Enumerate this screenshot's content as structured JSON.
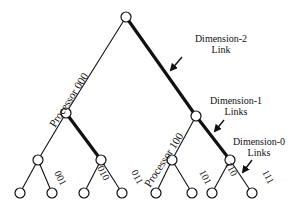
{
  "diagram": {
    "type": "binary-tree-hypercube-embedding",
    "colors": {
      "ink": "#111111",
      "background": "#ffffff"
    },
    "nodes": [
      {
        "id": "root",
        "x": 126,
        "y": 17
      },
      {
        "id": "n000",
        "x": 66,
        "y": 113
      },
      {
        "id": "n100",
        "x": 196,
        "y": 116
      },
      {
        "id": "l2a",
        "x": 38,
        "y": 160
      },
      {
        "id": "l2b",
        "x": 101,
        "y": 160
      },
      {
        "id": "l2c",
        "x": 172,
        "y": 160
      },
      {
        "id": "l2d",
        "x": 230,
        "y": 160
      },
      {
        "id": "leaf0",
        "x": 20,
        "y": 193
      },
      {
        "id": "leaf1",
        "x": 52,
        "y": 193
      },
      {
        "id": "leaf2",
        "x": 84,
        "y": 193
      },
      {
        "id": "leaf3",
        "x": 122,
        "y": 193
      },
      {
        "id": "leaf4",
        "x": 156,
        "y": 193
      },
      {
        "id": "leaf5",
        "x": 192,
        "y": 193
      },
      {
        "id": "leaf6",
        "x": 212,
        "y": 193
      },
      {
        "id": "leaf7",
        "x": 252,
        "y": 193
      }
    ],
    "edges": [
      {
        "from": "root",
        "to": "n000",
        "thick": false
      },
      {
        "from": "root",
        "to": "n100",
        "thick": true
      },
      {
        "from": "n000",
        "to": "l2a",
        "thick": false
      },
      {
        "from": "n000",
        "to": "l2b",
        "thick": true
      },
      {
        "from": "n100",
        "to": "l2c",
        "thick": false
      },
      {
        "from": "n100",
        "to": "l2d",
        "thick": true
      },
      {
        "from": "l2a",
        "to": "leaf0",
        "thick": false
      },
      {
        "from": "l2a",
        "to": "leaf1",
        "thick": false
      },
      {
        "from": "l2b",
        "to": "leaf2",
        "thick": false
      },
      {
        "from": "l2b",
        "to": "leaf3",
        "thick": false
      },
      {
        "from": "l2c",
        "to": "leaf4",
        "thick": false
      },
      {
        "from": "l2c",
        "to": "leaf5",
        "thick": false
      },
      {
        "from": "l2d",
        "to": "leaf6",
        "thick": false
      },
      {
        "from": "l2d",
        "to": "leaf7",
        "thick": false
      }
    ],
    "labels": {
      "processor_000": "Processor  000",
      "processor_100": "Processor  100",
      "p001": "001",
      "p010": "010",
      "p011": "011",
      "p101": "101",
      "p110": "110",
      "p111": "111"
    },
    "annotations": {
      "dim2_line1": "Dimension-2",
      "dim2_line2": "Link",
      "dim1_line1": "Dimension-1",
      "dim1_line2": "Links",
      "dim0_line1": "Dimension-0",
      "dim0_line2": "Links"
    }
  }
}
